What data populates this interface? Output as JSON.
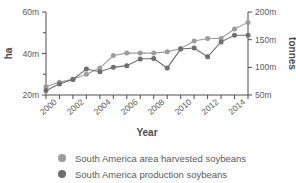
{
  "chart_data": {
    "type": "line",
    "title": "",
    "xlabel": "Year",
    "ylabel": "ha",
    "y2label": "tonnes",
    "grid": false,
    "legend_position": "bottom",
    "x": [
      1999,
      2000,
      2001,
      2002,
      2003,
      2004,
      2005,
      2006,
      2007,
      2008,
      2009,
      2010,
      2011,
      2012,
      2013,
      2014
    ],
    "xlim": [
      1999,
      2014
    ],
    "xticks": [
      2000,
      2002,
      2004,
      2006,
      2008,
      2010,
      2012,
      2014
    ],
    "xticklabels": [
      "2000",
      "2002",
      "2004",
      "2006",
      "2008",
      "2010",
      "2012",
      "2014"
    ],
    "ylim": [
      20000000,
      60000000
    ],
    "yticks": [
      20000000,
      40000000,
      60000000
    ],
    "yticklabels": [
      "20m",
      "40m",
      "60m"
    ],
    "y2lim": [
      50000000,
      200000000
    ],
    "y2ticks": [
      50000000,
      100000000,
      150000000,
      200000000
    ],
    "y2ticklabels": [
      "50m",
      "100m",
      "150m",
      "200m"
    ],
    "series": [
      {
        "name": "South America area harvested soybeans",
        "axis": "left",
        "unit": "ha",
        "color": "#9c9c9c",
        "values": [
          24000000,
          26200000,
          27600000,
          30000000,
          33000000,
          39000000,
          40200000,
          40200000,
          40200000,
          40800000,
          42400000,
          46000000,
          47200000,
          47200000,
          51800000,
          55000000
        ]
      },
      {
        "name": "South America production soybeans",
        "axis": "right",
        "unit": "tonnes",
        "color": "#6e6e6e",
        "values": [
          58000000,
          70000000,
          78000000,
          97000000,
          92000000,
          100000000,
          103000000,
          115000000,
          116000000,
          99000000,
          133000000,
          135000000,
          119000000,
          146000000,
          158000000,
          158000000
        ]
      }
    ]
  },
  "legend": {
    "items": [
      {
        "label": "South America area harvested soybeans",
        "color": "#9c9c9c"
      },
      {
        "label": "South America production soybeans",
        "color": "#6e6e6e"
      }
    ]
  },
  "axes": {
    "left_title": "ha",
    "right_title": "tonnes",
    "bottom_title": "Year"
  }
}
